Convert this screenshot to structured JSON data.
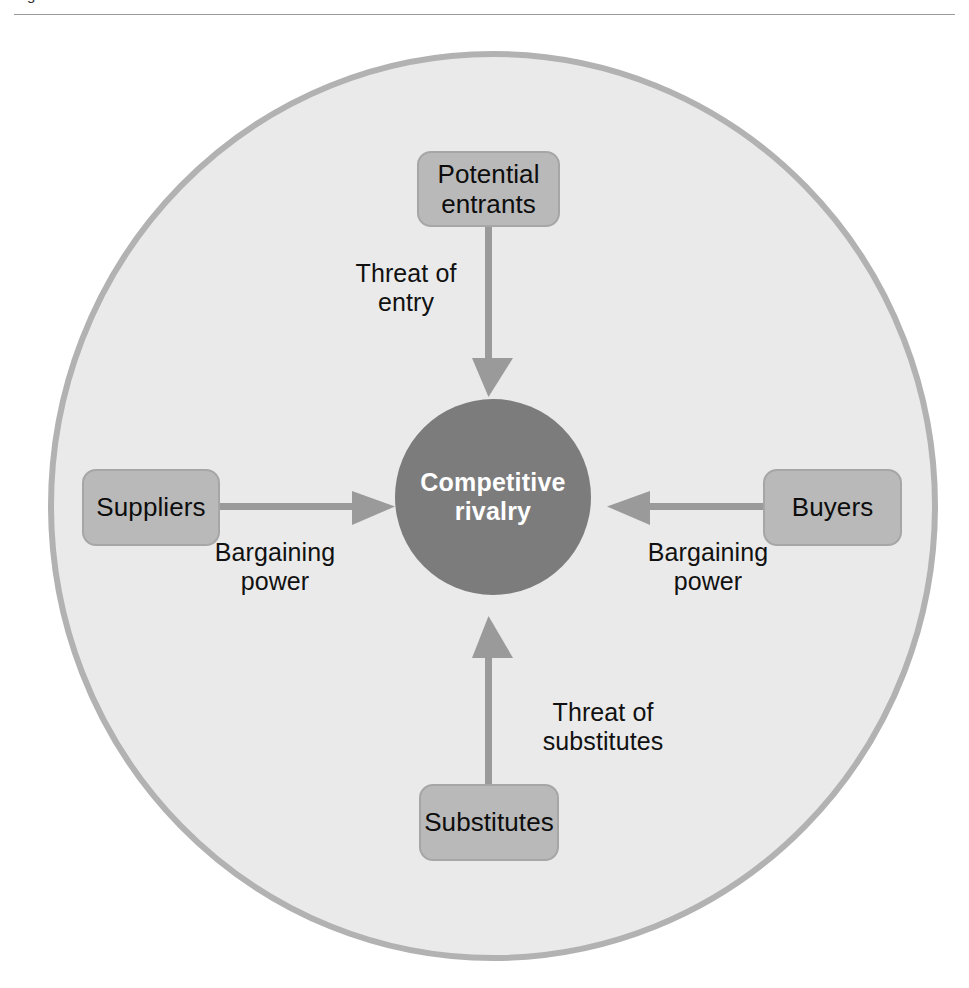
{
  "figure": {
    "caption": "Figure  The five forces framework",
    "rule_visible": true
  },
  "diagram": {
    "outer_ring": {
      "name": "industry-boundary",
      "fill": "#eaeaea",
      "stroke": "#b2b2b2"
    },
    "center": {
      "label": "Competitive\nrivalry",
      "fill": "#7c7c7c",
      "text_color": "#ffffff"
    },
    "box_fill": "#b9b9b9",
    "box_stroke": "#a6a6a6",
    "arrow_color": "#9a9a9a",
    "nodes": [
      {
        "id": "potential-entrants",
        "label": "Potential\nentrants",
        "position": "top"
      },
      {
        "id": "suppliers",
        "label": "Suppliers",
        "position": "left"
      },
      {
        "id": "buyers",
        "label": "Buyers",
        "position": "right"
      },
      {
        "id": "substitutes",
        "label": "Substitutes",
        "position": "bottom"
      }
    ],
    "forces": [
      {
        "id": "threat-of-entry",
        "label": "Threat of\nentry",
        "from": "potential-entrants",
        "to": "center",
        "direction": "down"
      },
      {
        "id": "supplier-bargaining-power",
        "label": "Bargaining\npower",
        "from": "suppliers",
        "to": "center",
        "direction": "right"
      },
      {
        "id": "buyer-bargaining-power",
        "label": "Bargaining\npower",
        "from": "buyers",
        "to": "center",
        "direction": "left"
      },
      {
        "id": "threat-of-substitutes",
        "label": "Threat of\nsubstitutes",
        "from": "substitutes",
        "to": "center",
        "direction": "up"
      }
    ]
  }
}
